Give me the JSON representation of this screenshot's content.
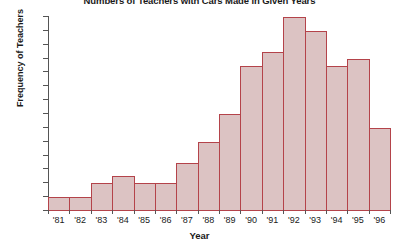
{
  "chart_data": {
    "type": "bar",
    "title": "Numbers of Teachers with Cars Made in Given Years",
    "xlabel": "Year",
    "ylabel": "Frequency of Teachers",
    "categories": [
      "'81",
      "'82",
      "'83",
      "'84",
      "'85",
      "'86",
      "'87",
      "'88",
      "'89",
      "'90",
      "'91",
      "'92",
      "'93",
      "'94",
      "'95",
      "'96"
    ],
    "values": [
      2,
      2,
      4,
      5,
      4,
      4,
      7,
      10,
      14,
      21,
      23,
      28,
      26,
      21,
      22,
      12
    ],
    "ylim": [
      0,
      28
    ],
    "xlim_note": "histogram bins, contiguous bars",
    "ytick_labels": [
      "0",
      "2",
      "4",
      "6",
      "8",
      "10",
      "12",
      "14",
      "16",
      "18",
      "20",
      "22",
      "24",
      "26",
      "28"
    ],
    "ytick_values": [
      0,
      2,
      4,
      6,
      8,
      10,
      12,
      14,
      16,
      18,
      20,
      22,
      24,
      26,
      28
    ],
    "grid": false,
    "legend": null,
    "bar_fill_color": "#dcc3c3",
    "bar_border_color": "#b4434a",
    "axis_color": "#555555",
    "background_color": "#ffffff",
    "text_color": "#1a1a1a"
  }
}
